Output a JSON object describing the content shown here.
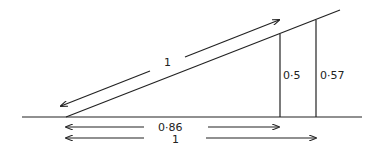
{
  "diagram": {
    "type": "right-triangle-geometry",
    "labels": {
      "hypotenuse": "1",
      "short_vertical": "0·5",
      "tall_vertical": "0·57",
      "base_short": "0·86",
      "base_long": "1"
    },
    "stroke_color": "#222222",
    "background": "#ffffff"
  }
}
